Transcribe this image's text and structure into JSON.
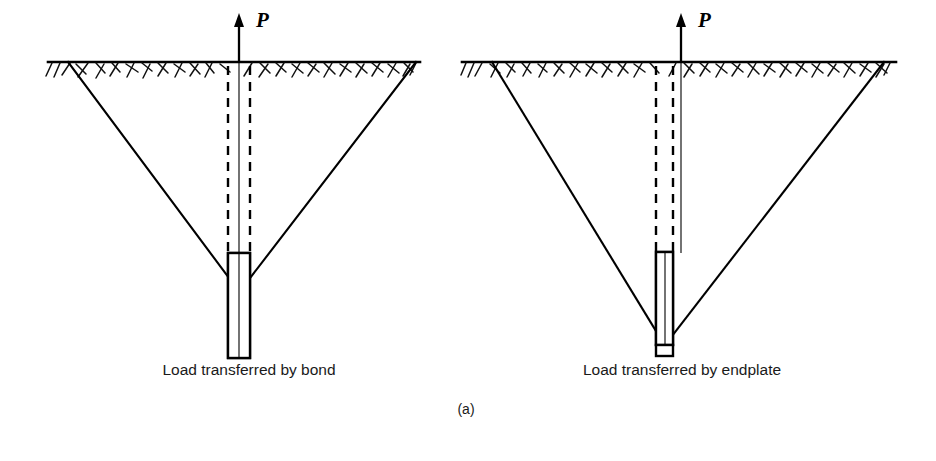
{
  "figure": {
    "panel_letter": "(a)",
    "background_color": "#ffffff",
    "ink_color": "#000000"
  },
  "panels": [
    {
      "id": "left",
      "caption": "Load transferred by bond",
      "load_label": "P",
      "load_direction": "up",
      "transfer_mode": "bond",
      "shaft_style": "dashed",
      "bond_zone_hatched": true,
      "endplate_present": false,
      "cone_apex_position": "top-of-bond-zone"
    },
    {
      "id": "right",
      "caption": "Load transferred by endplate",
      "load_label": "P",
      "load_direction": "up",
      "transfer_mode": "endplate",
      "shaft_style": "dashed",
      "bond_zone_hatched": true,
      "endplate_present": true,
      "cone_apex_position": "bottom-at-endplate"
    }
  ],
  "geometry": {
    "left": {
      "ground_y": 62,
      "ground_x1": 48,
      "ground_x2": 420,
      "axis_x": 239,
      "cone_left_x": 68,
      "cone_right_x": 416,
      "apex_y": 282,
      "shaft_left_x": 228,
      "shaft_right_x": 250,
      "dash_top_y": 66,
      "dash_bottom_y": 253,
      "bond_top_y": 253,
      "bond_bottom_y": 358
    },
    "right": {
      "ground_y": 62,
      "ground_x1": 462,
      "ground_x2": 896,
      "axis_x": 681,
      "cone_left_x": 492,
      "cone_right_x": 884,
      "apex_y": 336,
      "shaft_left_x": 656,
      "shaft_right_x": 673,
      "dash_top_y": 66,
      "dash_bottom_y": 252,
      "bond_top_y": 252,
      "bond_bottom_y": 345,
      "endplate_top_y": 345,
      "endplate_bottom_y": 356
    },
    "captions": {
      "left_x": 249,
      "right_x": 682,
      "y": 375,
      "letter_x": 466,
      "letter_y": 414
    }
  }
}
